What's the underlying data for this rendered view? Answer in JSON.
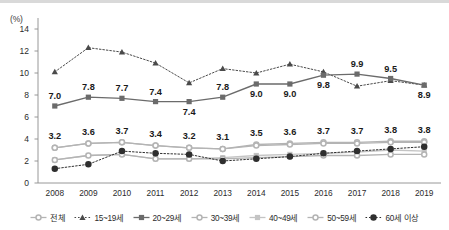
{
  "axis": {
    "unit_label": "(%)",
    "y_ticks": [
      "0",
      "2",
      "4",
      "6",
      "8",
      "10",
      "12",
      "14"
    ],
    "x_ticks": [
      "2008",
      "2009",
      "2010",
      "2011",
      "2012",
      "2013",
      "2014",
      "2015",
      "2016",
      "2017",
      "2018",
      "2019"
    ]
  },
  "legend": {
    "items": [
      {
        "label": "전체",
        "color": "#b4b4b4",
        "marker": "circle",
        "dash": "solid"
      },
      {
        "label": "15~19세",
        "color": "#4a4a4a",
        "marker": "triangle",
        "dash": "dotted"
      },
      {
        "label": "20~29세",
        "color": "#6b6b6b",
        "marker": "square",
        "dash": "solid"
      },
      {
        "label": "30~39세",
        "color": "#b4b4b4",
        "marker": "circle",
        "dash": "solid"
      },
      {
        "label": "40~49세",
        "color": "#c4c4c4",
        "marker": "square",
        "dash": "solid"
      },
      {
        "label": "50~59세",
        "color": "#b4b4b4",
        "marker": "circle",
        "dash": "solid"
      },
      {
        "label": "60세 이상",
        "color": "#2f2f2f",
        "marker": "circle",
        "dash": "dotted"
      }
    ]
  },
  "labels": {
    "top_series_name": "20~29세",
    "top_values": [
      "7.0",
      "7.8",
      "7.7",
      "7.4",
      "7.4",
      "7.8",
      "9.0",
      "9.0",
      "9.8",
      "9.9",
      "9.5",
      "8.9"
    ],
    "bottom_series_name": "전체",
    "bottom_values": [
      "3.2",
      "3.6",
      "3.7",
      "3.4",
      "3.2",
      "3.1",
      "3.5",
      "3.6",
      "3.7",
      "3.7",
      "3.8",
      "3.8"
    ]
  },
  "chart_data": {
    "type": "line",
    "title": "",
    "subtitle": "",
    "xlabel": "",
    "ylabel": "(%)",
    "ylim": [
      0,
      14
    ],
    "ytick_step": 2,
    "grid": false,
    "legend_position": "bottom",
    "x": [
      "2008",
      "2009",
      "2010",
      "2011",
      "2012",
      "2013",
      "2014",
      "2015",
      "2016",
      "2017",
      "2018",
      "2019"
    ],
    "series": [
      {
        "name": "전체",
        "color": "#b4b4b4",
        "marker": "circle",
        "dash": "solid",
        "labelled": true,
        "values": [
          3.2,
          3.6,
          3.7,
          3.4,
          3.2,
          3.1,
          3.5,
          3.6,
          3.7,
          3.7,
          3.8,
          3.8
        ]
      },
      {
        "name": "15~19세",
        "color": "#4a4a4a",
        "marker": "triangle",
        "dash": "dotted",
        "labelled": false,
        "values": [
          10.1,
          12.3,
          11.9,
          10.9,
          9.1,
          10.4,
          10.0,
          10.8,
          10.1,
          8.8,
          9.3,
          8.9
        ]
      },
      {
        "name": "20~29세",
        "color": "#6b6b6b",
        "marker": "square",
        "dash": "solid",
        "labelled": true,
        "values": [
          7.0,
          7.8,
          7.7,
          7.4,
          7.4,
          7.8,
          9.0,
          9.0,
          9.8,
          9.9,
          9.5,
          8.9
        ]
      },
      {
        "name": "30~39세",
        "color": "#b4b4b4",
        "marker": "circle",
        "dash": "solid",
        "labelled": false,
        "values": [
          3.2,
          3.6,
          3.7,
          3.4,
          3.2,
          3.1,
          3.4,
          3.5,
          3.6,
          3.6,
          3.7,
          3.7
        ]
      },
      {
        "name": "40~49세",
        "color": "#c4c4c4",
        "marker": "square",
        "dash": "solid",
        "labelled": false,
        "values": [
          2.1,
          2.5,
          2.6,
          2.2,
          2.2,
          2.3,
          2.5,
          2.6,
          2.7,
          2.8,
          3.0,
          2.9
        ]
      },
      {
        "name": "50~59세",
        "color": "#b4b4b4",
        "marker": "circle",
        "dash": "solid",
        "labelled": false,
        "values": [
          2.1,
          2.5,
          2.6,
          2.2,
          2.2,
          2.2,
          2.3,
          2.4,
          2.5,
          2.5,
          2.6,
          2.6
        ]
      },
      {
        "name": "60세 이상",
        "color": "#2f2f2f",
        "marker": "circle",
        "dash": "dotted",
        "labelled": false,
        "values": [
          1.3,
          1.7,
          2.9,
          2.7,
          2.6,
          2.0,
          2.2,
          2.4,
          2.7,
          2.9,
          3.1,
          3.3
        ]
      }
    ]
  }
}
